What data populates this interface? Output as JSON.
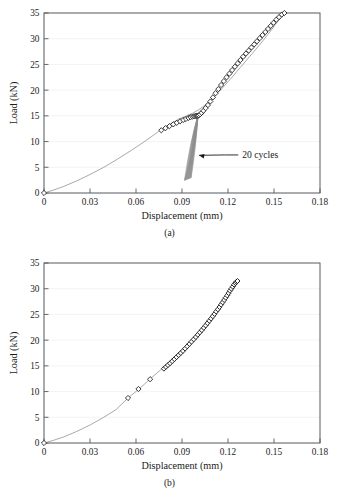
{
  "figure": {
    "panels": [
      {
        "id": "a",
        "caption": "(a)",
        "annotation": {
          "text": "20 cycles",
          "target_x": 0.0985,
          "target_y": 8.2
        }
      },
      {
        "id": "b",
        "caption": "(b)"
      }
    ]
  },
  "chart_data": [
    {
      "type": "line",
      "panel": "a",
      "title": "",
      "xlabel": "Displacement (mm)",
      "ylabel": "Load (kN)",
      "xlim": [
        0,
        0.18
      ],
      "ylim": [
        0,
        35
      ],
      "xticks": [
        "0",
        "0.03",
        "0.06",
        "0.09",
        "0.12",
        "0.15",
        "0.18"
      ],
      "xtick_values": [
        0,
        0.03,
        0.06,
        0.09,
        0.12,
        0.15,
        0.18
      ],
      "yticks": [
        "0",
        "5",
        "10",
        "15",
        "20",
        "25",
        "30",
        "35"
      ],
      "ytick_values": [
        0,
        5,
        10,
        15,
        20,
        25,
        30,
        35
      ],
      "grid": "horizontal",
      "legend": "none",
      "annotations": [
        {
          "text": "20 cycles",
          "x": 0.128,
          "y": 7.4,
          "points_to_x": 0.0985,
          "points_to_y": 8.3
        }
      ],
      "series": [
        {
          "name": "monotonic-loading-curve",
          "style": "line",
          "x": [
            0,
            0.006,
            0.013,
            0.021,
            0.03,
            0.039,
            0.048,
            0.057,
            0.066,
            0.074,
            0.081,
            0.0875,
            0.093,
            0.0975,
            0.1015,
            0.1055,
            0.11,
            0.116,
            0.122,
            0.128,
            0.134,
            0.14,
            0.146,
            0.151,
            0.157
          ],
          "y": [
            0,
            0.55,
            1.3,
            2.3,
            3.6,
            5.0,
            6.6,
            8.3,
            10.1,
            11.8,
            13.2,
            14.3,
            15.0,
            15.6,
            16.3,
            17.2,
            18.4,
            20.3,
            22.3,
            24.4,
            26.5,
            28.6,
            30.8,
            32.8,
            35.0
          ]
        },
        {
          "name": "diamond-markers-pre-cycling",
          "style": "markers",
          "x": [
            0,
            0.0765,
            0.0792,
            0.0818,
            0.0843,
            0.0866,
            0.0888,
            0.0908,
            0.0926,
            0.0942,
            0.0956,
            0.0968,
            0.0978,
            0.0986,
            0.0993,
            0.0999,
            0.1004
          ],
          "y": [
            0,
            12.2,
            12.6,
            13.0,
            13.35,
            13.65,
            13.95,
            14.2,
            14.4,
            14.6,
            14.75,
            14.85,
            14.92,
            14.97,
            15.0,
            15.02,
            15.03
          ]
        },
        {
          "name": "diamond-markers-post-cycling",
          "style": "markers",
          "x": [
            0.101,
            0.1018,
            0.1028,
            0.104,
            0.1054,
            0.1069,
            0.1085,
            0.1102,
            0.1119,
            0.1137,
            0.1155,
            0.1173,
            0.1191,
            0.1209,
            0.1227,
            0.1245,
            0.1263,
            0.1281,
            0.1299,
            0.1317,
            0.1335,
            0.1353,
            0.1371,
            0.1389,
            0.1407,
            0.1425,
            0.1443,
            0.1461,
            0.1479,
            0.1497,
            0.1515,
            0.1533,
            0.1551,
            0.1568
          ],
          "y": [
            15.1,
            15.3,
            15.6,
            16.0,
            16.5,
            17.1,
            17.8,
            18.6,
            19.4,
            20.2,
            21.0,
            21.75,
            22.5,
            23.2,
            23.9,
            24.55,
            25.2,
            25.85,
            26.5,
            27.1,
            27.7,
            28.3,
            28.9,
            29.5,
            30.1,
            30.7,
            31.3,
            31.9,
            32.5,
            33.1,
            33.7,
            34.2,
            34.7,
            35.0
          ]
        },
        {
          "name": "cyclic-hysteresis-bundle",
          "style": "cycles",
          "count": 20,
          "peak_x": 0.1005,
          "peak_y": 15.0,
          "valley_x_start": 0.0915,
          "valley_x_end": 0.096,
          "valley_y": 2.4
        }
      ]
    },
    {
      "type": "line",
      "panel": "b",
      "title": "",
      "xlabel": "Displacement (mm)",
      "ylabel": "Load (kN)",
      "xlim": [
        0,
        0.18
      ],
      "ylim": [
        0,
        35
      ],
      "xticks": [
        "0",
        "0.03",
        "0.06",
        "0.09",
        "0.12",
        "0.15",
        "0.18"
      ],
      "xtick_values": [
        0,
        0.03,
        0.06,
        0.09,
        0.12,
        0.15,
        0.18
      ],
      "yticks": [
        "0",
        "5",
        "10",
        "15",
        "20",
        "25",
        "30",
        "35"
      ],
      "ytick_values": [
        0,
        5,
        10,
        15,
        20,
        25,
        30,
        35
      ],
      "grid": "horizontal",
      "legend": "none",
      "annotations": [],
      "series": [
        {
          "name": "monotonic-loading-curve",
          "style": "line",
          "x": [
            0,
            0.006,
            0.013,
            0.021,
            0.03,
            0.039,
            0.047,
            0.055,
            0.062,
            0.069,
            0.076,
            0.082,
            0.088,
            0.094,
            0.1,
            0.106,
            0.112,
            0.118,
            0.123,
            0.1262
          ],
          "y": [
            0,
            0.5,
            1.2,
            2.2,
            3.5,
            5.0,
            6.5,
            8.8,
            10.5,
            12.4,
            14.2,
            15.8,
            17.5,
            19.3,
            21.3,
            23.5,
            25.9,
            28.3,
            30.4,
            31.5
          ]
        },
        {
          "name": "diamond-markers-sparse",
          "style": "markers",
          "x": [
            0,
            0.0548,
            0.0616,
            0.0692
          ],
          "y": [
            0,
            8.75,
            10.5,
            12.4
          ]
        },
        {
          "name": "diamond-markers-dense",
          "style": "markers-dense",
          "x": [
            0.0782,
            0.0795,
            0.0808,
            0.0822,
            0.0836,
            0.085,
            0.0864,
            0.0878,
            0.0892,
            0.0906,
            0.092,
            0.0934,
            0.0948,
            0.0962,
            0.0976,
            0.099,
            0.1003,
            0.1016,
            0.1029,
            0.1042,
            0.1054,
            0.1066,
            0.1078,
            0.109,
            0.1101,
            0.1112,
            0.1123,
            0.1134,
            0.1145,
            0.1155,
            0.1165,
            0.1175,
            0.1185,
            0.1195,
            0.1204,
            0.1213,
            0.1222,
            0.1231,
            0.124,
            0.1248,
            0.1255,
            0.1262
          ],
          "y": [
            14.45,
            14.8,
            15.15,
            15.5,
            15.9,
            16.3,
            16.7,
            17.1,
            17.5,
            17.9,
            18.35,
            18.8,
            19.25,
            19.7,
            20.15,
            20.6,
            21.05,
            21.5,
            21.95,
            22.4,
            22.85,
            23.3,
            23.75,
            24.2,
            24.65,
            25.1,
            25.55,
            26.0,
            26.45,
            26.9,
            27.35,
            27.8,
            28.25,
            28.7,
            29.15,
            29.6,
            30.0,
            30.4,
            30.8,
            31.1,
            31.35,
            31.5
          ]
        }
      ]
    }
  ]
}
